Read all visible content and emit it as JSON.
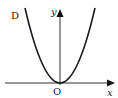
{
  "figure": {
    "labels": {
      "curve": "D",
      "y_axis": "y",
      "x_axis": "x",
      "origin": "O"
    },
    "colors": {
      "axis": "#333333",
      "curve": "#1a1a1a",
      "background": "#ffffff"
    },
    "geometry": {
      "origin": [
        60,
        83
      ],
      "x_axis": {
        "from": [
          5,
          83
        ],
        "to": [
          115,
          83
        ]
      },
      "y_axis": {
        "from": [
          60,
          85
        ],
        "to": [
          60,
          9
        ]
      },
      "parabola": {
        "vertex": [
          60,
          83
        ],
        "left_top": [
          25,
          8
        ],
        "right_top": [
          95,
          8
        ]
      }
    }
  }
}
